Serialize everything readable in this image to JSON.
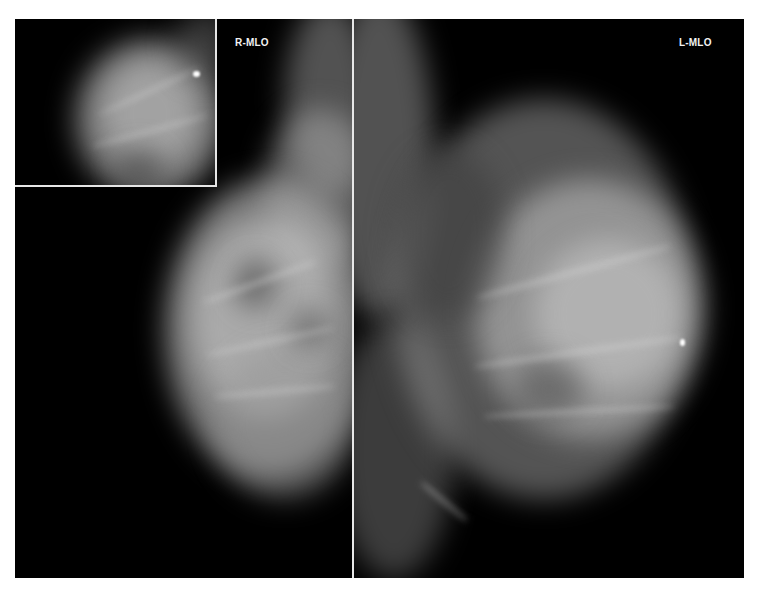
{
  "figure": {
    "panels": [
      {
        "id": "right-mlo",
        "label": "R-MLO",
        "position": "left"
      },
      {
        "id": "left-mlo",
        "label": "L-MLO",
        "position": "right"
      }
    ],
    "inset": {
      "description": "magnified view of R-MLO region with bright focus"
    },
    "colors": {
      "background": "#000000",
      "divider": "#e8e8e8",
      "label": "#f2f2f2",
      "page": "#ffffff"
    }
  }
}
